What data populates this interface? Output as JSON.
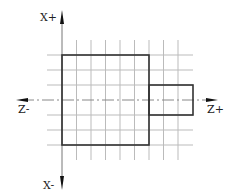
{
  "diagram": {
    "type": "coordinate-grid-with-shapes",
    "axes": {
      "x_positive_label": "X+",
      "x_negative_label": "X-",
      "z_positive_label": "Z+",
      "z_negative_label": "Z-"
    },
    "grid": {
      "vertical_lines_x": [
        62,
        76.5,
        91,
        105.5,
        120,
        134.5,
        149,
        163.5,
        178
      ],
      "vertical_y_range": [
        40,
        160
      ],
      "horizontal_lines_y": [
        55,
        70,
        85,
        115,
        130,
        145
      ],
      "horizontal_x_range": [
        47,
        193
      ]
    },
    "shapes": [
      {
        "name": "large-rectangle",
        "x": 62,
        "y": 55,
        "width": 87,
        "height": 90
      },
      {
        "name": "small-rectangle",
        "x": 149,
        "y": 85,
        "width": 44,
        "height": 30
      }
    ],
    "colors": {
      "grid": "#b8b8b8",
      "outline": "#333333",
      "axis": "#555555"
    }
  }
}
